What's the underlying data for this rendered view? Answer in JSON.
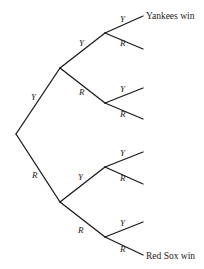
{
  "diagram": {
    "type": "probability-tree",
    "stroke_color": "#1a1a1a",
    "text_color": "#222222",
    "nodes": [
      {
        "id": "root",
        "x": 16,
        "y": 134
      },
      {
        "id": "Y",
        "x": 60,
        "y": 68
      },
      {
        "id": "R",
        "x": 60,
        "y": 202
      },
      {
        "id": "YY",
        "x": 105,
        "y": 33
      },
      {
        "id": "YR",
        "x": 105,
        "y": 103
      },
      {
        "id": "RY",
        "x": 105,
        "y": 167
      },
      {
        "id": "RR",
        "x": 105,
        "y": 237
      },
      {
        "id": "YYY",
        "x": 143,
        "y": 16
      },
      {
        "id": "YYR",
        "x": 143,
        "y": 49
      },
      {
        "id": "YRY",
        "x": 143,
        "y": 88
      },
      {
        "id": "YRR",
        "x": 143,
        "y": 119
      },
      {
        "id": "RYY",
        "x": 143,
        "y": 152
      },
      {
        "id": "RYR",
        "x": 143,
        "y": 184
      },
      {
        "id": "RRY",
        "x": 143,
        "y": 222
      },
      {
        "id": "RRR",
        "x": 143,
        "y": 255
      }
    ],
    "edges": [
      {
        "from": "root",
        "to": "Y",
        "label": "Y",
        "lx": 31,
        "ly": 100
      },
      {
        "from": "root",
        "to": "R",
        "label": "R",
        "lx": 32,
        "ly": 178
      },
      {
        "from": "Y",
        "to": "YY",
        "label": "Y",
        "lx": 79,
        "ly": 46
      },
      {
        "from": "Y",
        "to": "YR",
        "label": "R",
        "lx": 79,
        "ly": 95
      },
      {
        "from": "R",
        "to": "RY",
        "label": "Y",
        "lx": 78,
        "ly": 180
      },
      {
        "from": "R",
        "to": "RR",
        "label": "R",
        "lx": 78,
        "ly": 233
      },
      {
        "from": "YY",
        "to": "YYY",
        "label": "Y",
        "lx": 120,
        "ly": 22
      },
      {
        "from": "YY",
        "to": "YYR",
        "label": "R",
        "lx": 120,
        "ly": 46
      },
      {
        "from": "YR",
        "to": "YRY",
        "label": "Y",
        "lx": 120,
        "ly": 92
      },
      {
        "from": "YR",
        "to": "YRR",
        "label": "R",
        "lx": 120,
        "ly": 117
      },
      {
        "from": "RY",
        "to": "RYY",
        "label": "Y",
        "lx": 120,
        "ly": 156
      },
      {
        "from": "RY",
        "to": "RYR",
        "label": "R",
        "lx": 120,
        "ly": 181
      },
      {
        "from": "RR",
        "to": "RRY",
        "label": "Y",
        "lx": 120,
        "ly": 226
      },
      {
        "from": "RR",
        "to": "RRR",
        "label": "R",
        "lx": 120,
        "ly": 252
      }
    ],
    "outcomes": [
      {
        "node": "YYY",
        "label": "Yankees win",
        "x": 146,
        "y": 19
      },
      {
        "node": "RRR",
        "label": "Red Sox win",
        "x": 146,
        "y": 259
      }
    ]
  }
}
